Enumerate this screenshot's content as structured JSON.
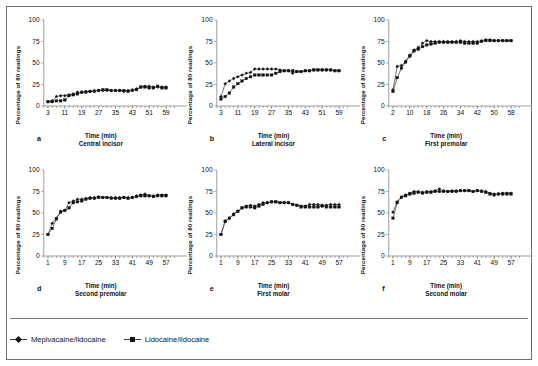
{
  "figure": {
    "ylabel": "Percentage of 80 readings",
    "xlabel": "Time (min)",
    "yticks": [
      0,
      25,
      50,
      75,
      100
    ],
    "ylim": [
      0,
      100
    ]
  },
  "legend": {
    "items": [
      {
        "label": "Mepivacaine/lidocaine",
        "marker": "diamond"
      },
      {
        "label": "Lidocaine/lidocaine",
        "marker": "square"
      }
    ]
  },
  "chart_data": [
    {
      "panel": "a",
      "type": "line",
      "title": "Central incisor",
      "xlabel": "Time (min)",
      "ylabel": "Percentage of 80 readings",
      "xticks": [
        3,
        11,
        19,
        27,
        35,
        43,
        51,
        59
      ],
      "xlim": [
        1,
        63
      ],
      "ylim": [
        0,
        100
      ],
      "x": [
        3,
        5,
        7,
        9,
        11,
        13,
        15,
        17,
        19,
        21,
        23,
        25,
        27,
        29,
        31,
        33,
        35,
        37,
        39,
        41,
        43,
        45,
        47,
        49,
        51,
        53,
        55,
        57,
        59
      ],
      "series": [
        {
          "name": "Mepivacaine/lidocaine",
          "marker": "diamond",
          "values": [
            5,
            6,
            11,
            12,
            12,
            13,
            14,
            16,
            16,
            17,
            17,
            18,
            18,
            18,
            18,
            18,
            18,
            18,
            17,
            18,
            19,
            20,
            22,
            23,
            23,
            22,
            22,
            22,
            22
          ]
        },
        {
          "name": "Lidocaine/lidocaine",
          "marker": "square",
          "values": [
            5,
            5,
            6,
            6,
            7,
            12,
            13,
            14,
            16,
            16,
            17,
            17,
            18,
            19,
            19,
            18,
            18,
            18,
            18,
            17,
            18,
            19,
            22,
            22,
            21,
            21,
            23,
            21,
            21
          ]
        }
      ]
    },
    {
      "panel": "b",
      "type": "line",
      "title": "Lateral incisor",
      "xlabel": "Time (min)",
      "ylabel": "Percentage of 80 readings",
      "xticks": [
        3,
        11,
        19,
        27,
        35,
        43,
        51,
        59
      ],
      "xlim": [
        1,
        63
      ],
      "ylim": [
        0,
        100
      ],
      "x": [
        3,
        5,
        7,
        9,
        11,
        13,
        15,
        17,
        19,
        21,
        23,
        25,
        27,
        29,
        31,
        33,
        35,
        37,
        39,
        41,
        43,
        45,
        47,
        49,
        51,
        53,
        55,
        57,
        59
      ],
      "series": [
        {
          "name": "Mepivacaine/lidocaine",
          "marker": "diamond",
          "values": [
            11,
            26,
            29,
            32,
            34,
            36,
            38,
            39,
            43,
            43,
            43,
            43,
            43,
            43,
            42,
            41,
            41,
            38,
            40,
            40,
            41,
            41,
            42,
            42,
            42,
            42,
            42,
            41,
            41
          ]
        },
        {
          "name": "Lidocaine/lidocaine",
          "marker": "square",
          "values": [
            8,
            11,
            15,
            22,
            26,
            29,
            32,
            34,
            36,
            36,
            36,
            36,
            36,
            38,
            40,
            41,
            41,
            41,
            40,
            40,
            41,
            41,
            42,
            42,
            42,
            42,
            42,
            41,
            41
          ]
        }
      ]
    },
    {
      "panel": "c",
      "type": "line",
      "title": "First premolar",
      "xlabel": "Time (min)",
      "ylabel": "Percentage of 80 readings",
      "xticks": [
        2,
        10,
        18,
        26,
        34,
        42,
        50,
        58
      ],
      "xlim": [
        0,
        62
      ],
      "ylim": [
        0,
        100
      ],
      "x": [
        2,
        4,
        6,
        8,
        10,
        12,
        14,
        16,
        18,
        20,
        22,
        24,
        26,
        28,
        30,
        32,
        34,
        36,
        38,
        40,
        42,
        44,
        46,
        48,
        50,
        52,
        54,
        56,
        58
      ],
      "series": [
        {
          "name": "Mepivacaine/lidocaine",
          "marker": "diamond",
          "values": [
            19,
            46,
            47,
            52,
            59,
            65,
            68,
            73,
            76,
            75,
            75,
            75,
            75,
            75,
            75,
            75,
            76,
            75,
            75,
            75,
            75,
            76,
            77,
            77,
            76,
            76,
            76,
            76,
            76
          ]
        },
        {
          "name": "Lidocaine/lidocaine",
          "marker": "square",
          "values": [
            17,
            33,
            44,
            51,
            58,
            64,
            66,
            69,
            71,
            72,
            73,
            74,
            74,
            74,
            74,
            74,
            74,
            73,
            73,
            73,
            73,
            75,
            76,
            76,
            76,
            76,
            76,
            76,
            76
          ]
        }
      ]
    },
    {
      "panel": "d",
      "type": "line",
      "title": "Second premolar",
      "xlabel": "Time (min)",
      "ylabel": "Percentage of 80 readings",
      "xticks": [
        1,
        9,
        17,
        25,
        33,
        41,
        49,
        57
      ],
      "xlim": [
        -1,
        61
      ],
      "ylim": [
        0,
        100
      ],
      "x": [
        1,
        3,
        5,
        7,
        9,
        11,
        13,
        15,
        17,
        19,
        21,
        23,
        25,
        27,
        29,
        31,
        33,
        35,
        37,
        39,
        41,
        43,
        45,
        47,
        49,
        51,
        53,
        55,
        57
      ],
      "series": [
        {
          "name": "Mepivacaine/lidocaine",
          "marker": "diamond",
          "values": [
            25,
            38,
            44,
            52,
            53,
            62,
            64,
            66,
            66,
            67,
            68,
            68,
            69,
            68,
            68,
            68,
            68,
            68,
            68,
            68,
            68,
            70,
            71,
            72,
            70,
            70,
            71,
            71,
            71
          ]
        },
        {
          "name": "Lidocaine/lidocaine",
          "marker": "square",
          "values": [
            25,
            32,
            43,
            51,
            53,
            56,
            62,
            63,
            64,
            66,
            67,
            67,
            68,
            68,
            68,
            67,
            67,
            67,
            68,
            67,
            68,
            69,
            70,
            70,
            70,
            69,
            70,
            70,
            70
          ]
        }
      ]
    },
    {
      "panel": "e",
      "type": "line",
      "title": "First molar",
      "xlabel": "Time (min)",
      "ylabel": "Percentage of 80 readings",
      "xticks": [
        1,
        9,
        17,
        25,
        33,
        41,
        49,
        57
      ],
      "xlim": [
        -1,
        61
      ],
      "ylim": [
        0,
        100
      ],
      "x": [
        1,
        3,
        5,
        7,
        9,
        11,
        13,
        15,
        17,
        19,
        21,
        23,
        25,
        27,
        29,
        31,
        33,
        35,
        37,
        39,
        41,
        43,
        45,
        47,
        49,
        51,
        53,
        55,
        57
      ],
      "series": [
        {
          "name": "Mepivacaine/lidocaine",
          "marker": "diamond",
          "values": [
            25,
            41,
            44,
            49,
            52,
            56,
            58,
            59,
            58,
            60,
            62,
            62,
            63,
            63,
            62,
            62,
            62,
            60,
            59,
            58,
            58,
            60,
            60,
            60,
            59,
            59,
            60,
            60,
            60
          ]
        },
        {
          "name": "Lidocaine/lidocaine",
          "marker": "square",
          "values": [
            25,
            40,
            44,
            48,
            52,
            56,
            57,
            57,
            56,
            58,
            60,
            62,
            63,
            63,
            62,
            62,
            62,
            60,
            59,
            57,
            57,
            57,
            57,
            57,
            58,
            57,
            57,
            57,
            57
          ]
        }
      ]
    },
    {
      "panel": "f",
      "type": "line",
      "title": "Second molar",
      "xlabel": "Time (min)",
      "ylabel": "Percentage of 80 readings",
      "xticks": [
        1,
        9,
        17,
        25,
        33,
        41,
        49,
        57
      ],
      "xlim": [
        -1,
        61
      ],
      "ylim": [
        0,
        100
      ],
      "x": [
        1,
        3,
        5,
        7,
        9,
        11,
        13,
        15,
        17,
        19,
        21,
        23,
        25,
        27,
        29,
        31,
        33,
        35,
        37,
        39,
        41,
        43,
        45,
        47,
        49,
        51,
        53,
        55,
        57
      ],
      "series": [
        {
          "name": "Mepivacaine/lidocaine",
          "marker": "diamond",
          "values": [
            51,
            63,
            69,
            71,
            73,
            75,
            75,
            74,
            75,
            75,
            76,
            78,
            76,
            75,
            76,
            76,
            76,
            76,
            76,
            75,
            76,
            76,
            75,
            73,
            72,
            72,
            73,
            73,
            73
          ]
        },
        {
          "name": "Lidocaine/lidocaine",
          "marker": "square",
          "values": [
            44,
            62,
            68,
            70,
            72,
            73,
            74,
            73,
            74,
            74,
            75,
            75,
            75,
            75,
            75,
            75,
            76,
            76,
            76,
            75,
            76,
            75,
            74,
            72,
            71,
            72,
            72,
            72,
            72
          ]
        }
      ]
    }
  ]
}
